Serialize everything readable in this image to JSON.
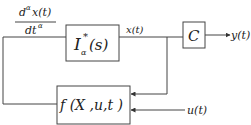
{
  "diagram": {
    "type": "block-diagram",
    "input_label_top": {
      "numerator_d": "d",
      "numerator_sup": "α",
      "numerator_rest": "x(t)",
      "denominator_d": "dt",
      "denominator_sup": "α"
    },
    "blocks": [
      {
        "id": "integrator",
        "label_main": "I",
        "label_sub": "α",
        "label_sup": "*",
        "label_rest": "(s)"
      },
      {
        "id": "output-matrix",
        "label": "C"
      },
      {
        "id": "system-function",
        "label": "f (X ,u,t )"
      }
    ],
    "signals": {
      "state": "x(t)",
      "output": "y(t)",
      "input": "u(t)"
    },
    "colors": {
      "line": "#444444",
      "text": "#222222",
      "background": "#ffffff"
    }
  }
}
